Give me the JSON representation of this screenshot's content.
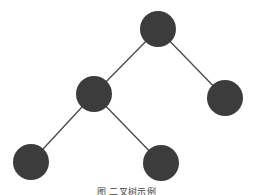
{
  "figure": {
    "kind": "binary-tree-diagram",
    "background_color": "#ffffff",
    "node_color": "#3c3c3c",
    "edge_color": "#4b4b4b",
    "node_radius": 18,
    "edge_width": 1.35,
    "caption": "图 二叉树示例",
    "caption_note": "clipped at bottom edge of image",
    "nodes": [
      {
        "id": "root",
        "label": "",
        "cx": 158,
        "cy": 29,
        "r": 18
      },
      {
        "id": "left-child",
        "label": "",
        "cx": 94,
        "cy": 94,
        "r": 18
      },
      {
        "id": "right-child",
        "label": "",
        "cx": 225,
        "cy": 98,
        "r": 18
      },
      {
        "id": "left-left",
        "label": "",
        "cx": 31,
        "cy": 162,
        "r": 18
      },
      {
        "id": "left-right",
        "label": "",
        "cx": 161,
        "cy": 163,
        "r": 18
      }
    ],
    "edges": [
      {
        "id": "root-to-left",
        "from": "root",
        "to": "left-child",
        "x1": 158,
        "y1": 29,
        "x2": 94,
        "y2": 94
      },
      {
        "id": "root-to-right",
        "from": "root",
        "to": "right-child",
        "x1": 158,
        "y1": 29,
        "x2": 225,
        "y2": 98
      },
      {
        "id": "left-to-leftleft",
        "from": "left-child",
        "to": "left-left",
        "x1": 94,
        "y1": 94,
        "x2": 31,
        "y2": 162
      },
      {
        "id": "left-to-leftright",
        "from": "left-child",
        "to": "left-right",
        "x1": 94,
        "y1": 94,
        "x2": 161,
        "y2": 163
      }
    ]
  }
}
